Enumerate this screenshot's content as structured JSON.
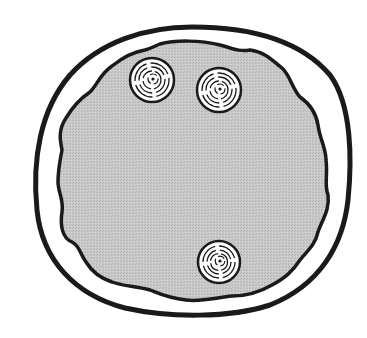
{
  "figure": {
    "title": "",
    "caption": "",
    "background": "#ffffff",
    "outline_color": "#1a1a1a",
    "fill_color": "#c4c4c4",
    "colony_fill": "#ffffff",
    "elements": {
      "outer_rim": {
        "label": "outer-rim",
        "center": [
          192,
          170
        ],
        "rx": 157,
        "ry": 144
      },
      "inner_medium": {
        "label": "inner-medium"
      },
      "colonies": [
        {
          "label": "colony-1",
          "cx": 152,
          "cy": 80,
          "r": 22
        },
        {
          "label": "colony-2",
          "cx": 219,
          "cy": 90,
          "r": 22
        },
        {
          "label": "colony-3",
          "cx": 219,
          "cy": 262,
          "r": 21
        }
      ]
    }
  }
}
